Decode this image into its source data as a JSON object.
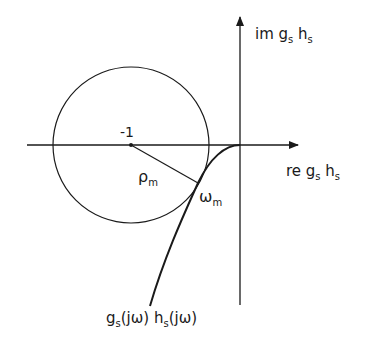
{
  "diagram": {
    "type": "nyquist-plot",
    "axes": {
      "imag_label": {
        "main": "im g",
        "sub1": "s",
        "mid": " h",
        "sub2": "s"
      },
      "real_label": {
        "main": "re g",
        "sub1": "s",
        "mid": " h",
        "sub2": "s"
      }
    },
    "critical_point_label": "-1",
    "radius_label": {
      "main": "ρ",
      "sub": "m"
    },
    "tangent_label": {
      "main": "ω",
      "sub": "m"
    },
    "curve_label": {
      "p1": "g",
      "s1": "s",
      "p2": "(jω) h",
      "s2": "s",
      "p3": "(jω)"
    },
    "colors": {
      "stroke": "#1a1a1a",
      "background": "#ffffff"
    }
  }
}
